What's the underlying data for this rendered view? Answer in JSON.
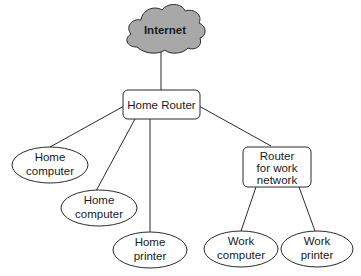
{
  "diagram": {
    "type": "network-topology",
    "colors": {
      "cloud_fill": "#a8a8a8",
      "stroke": "#2a2a2a",
      "node_fill": "#ffffff"
    },
    "nodes": {
      "internet": {
        "shape": "cloud",
        "label": "Internet"
      },
      "home_router": {
        "shape": "rounded-box",
        "label": "Home Router"
      },
      "home_computer_1": {
        "shape": "ellipse",
        "line1": "Home",
        "line2": "computer"
      },
      "home_computer_2": {
        "shape": "ellipse",
        "line1": "Home",
        "line2": "computer"
      },
      "home_printer": {
        "shape": "ellipse",
        "line1": "Home",
        "line2": "printer"
      },
      "work_router": {
        "shape": "rounded-box",
        "line1": "Router",
        "line2": "for work",
        "line3": "network"
      },
      "work_computer": {
        "shape": "ellipse",
        "line1": "Work",
        "line2": "computer"
      },
      "work_printer": {
        "shape": "ellipse",
        "line1": "Work",
        "line2": "printer"
      }
    },
    "edges": [
      {
        "from": "Internet",
        "to": "Home Router"
      },
      {
        "from": "Home Router",
        "to": "Home computer"
      },
      {
        "from": "Home Router",
        "to": "Home computer"
      },
      {
        "from": "Home Router",
        "to": "Home printer"
      },
      {
        "from": "Home Router",
        "to": "Router for work network"
      },
      {
        "from": "Router for work network",
        "to": "Work computer"
      },
      {
        "from": "Router for work network",
        "to": "Work printer"
      }
    ]
  }
}
